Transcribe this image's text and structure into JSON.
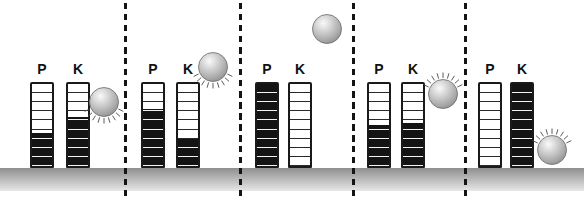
{
  "figure_labels": {
    "potential": "P",
    "kinetic": "K"
  },
  "bar_segments": 9,
  "separators_x": [
    124,
    239,
    352,
    464
  ],
  "colors": {
    "bar_outline": "#1a1a1a",
    "bar_fill": "#141414",
    "bar_gridline": "#2a2a2a",
    "separator": "#141414",
    "ground_top": "#8f8f8f",
    "ground_bottom": "#e8e8e8",
    "label_color": "#111111",
    "ball_gradient": [
      "#fafafa",
      "#cfcfcf",
      "#a6a6a6",
      "#8b8b8b"
    ],
    "ball_rim": "#6b6b6b",
    "spike_color": "#4a4a4a"
  },
  "panels": [
    {
      "bars": [
        {
          "label": "P",
          "fill_percent": 40,
          "x": 30
        },
        {
          "label": "K",
          "fill_percent": 60,
          "x": 66
        }
      ],
      "ball": {
        "x": 104,
        "y": 102,
        "motion_spikes": "below"
      }
    },
    {
      "bars": [
        {
          "label": "P",
          "fill_percent": 70,
          "x": 141
        },
        {
          "label": "K",
          "fill_percent": 33,
          "x": 176
        }
      ],
      "ball": {
        "x": 213,
        "y": 67,
        "motion_spikes": "below"
      }
    },
    {
      "bars": [
        {
          "label": "P",
          "fill_percent": 100,
          "x": 255
        },
        {
          "label": "K",
          "fill_percent": 0,
          "x": 288
        }
      ],
      "ball": {
        "x": 327,
        "y": 29,
        "motion_spikes": "none"
      }
    },
    {
      "bars": [
        {
          "label": "P",
          "fill_percent": 50,
          "x": 367
        },
        {
          "label": "K",
          "fill_percent": 52,
          "x": 401
        }
      ],
      "ball": {
        "x": 443,
        "y": 94,
        "motion_spikes": "above"
      }
    },
    {
      "bars": [
        {
          "label": "P",
          "fill_percent": 0,
          "x": 478
        },
        {
          "label": "K",
          "fill_percent": 100,
          "x": 510
        }
      ],
      "ball": {
        "x": 552,
        "y": 150,
        "motion_spikes": "above"
      }
    }
  ]
}
